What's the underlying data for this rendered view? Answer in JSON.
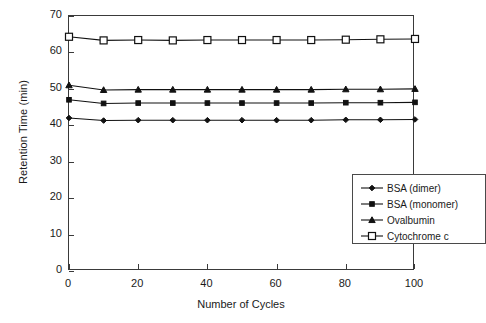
{
  "chart_data": {
    "type": "line",
    "title": "",
    "xlabel": "Number of Cycles",
    "ylabel": "Retention Time (min)",
    "xlim": [
      0,
      100
    ],
    "ylim": [
      0,
      70
    ],
    "xticks": [
      0,
      20,
      40,
      60,
      80,
      100
    ],
    "yticks": [
      0,
      10,
      20,
      30,
      40,
      50,
      60,
      70
    ],
    "grid": false,
    "legend_position": "lower right",
    "x": [
      0,
      10,
      20,
      30,
      40,
      50,
      60,
      70,
      80,
      90,
      100
    ],
    "series": [
      {
        "name": "Cytochrome c",
        "marker": "open-square",
        "values": [
          64.3,
          63.3,
          63.4,
          63.3,
          63.4,
          63.4,
          63.4,
          63.4,
          63.5,
          63.6,
          63.7
        ]
      },
      {
        "name": "Ovalbumin",
        "marker": "filled-triangle",
        "values": [
          51.0,
          49.7,
          49.8,
          49.8,
          49.8,
          49.8,
          49.8,
          49.8,
          49.9,
          49.9,
          50.0
        ]
      },
      {
        "name": "BSA (monomer)",
        "marker": "filled-square",
        "values": [
          47.0,
          46.0,
          46.1,
          46.1,
          46.1,
          46.1,
          46.1,
          46.1,
          46.2,
          46.2,
          46.3
        ]
      },
      {
        "name": "BSA (dimer)",
        "marker": "filled-diamond",
        "values": [
          42.0,
          41.3,
          41.4,
          41.4,
          41.4,
          41.4,
          41.4,
          41.4,
          41.5,
          41.5,
          41.6
        ]
      }
    ]
  },
  "legend": {
    "items": [
      {
        "label": "BSA (dimer)",
        "marker": "filled-diamond"
      },
      {
        "label": "BSA (monomer)",
        "marker": "filled-square"
      },
      {
        "label": "Ovalbumin",
        "marker": "filled-triangle"
      },
      {
        "label": "Cytochrome c",
        "marker": "open-square"
      }
    ]
  },
  "axis_titles": {
    "x": "Number of Cycles",
    "y": "Retention Time (min)"
  },
  "colors": {
    "line": "#111111",
    "frame": "#3a3a3a",
    "text": "#1a1a1a",
    "background": "#ffffff"
  }
}
